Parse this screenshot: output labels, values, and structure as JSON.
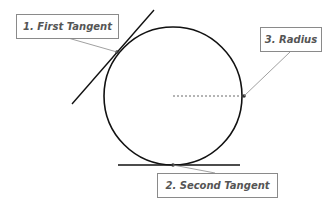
{
  "diagram": {
    "labels": {
      "first_tangent": "1. First Tangent",
      "second_tangent": "2. Second Tangent",
      "radius": "3. Radius"
    },
    "circle": {
      "cx": 173,
      "cy": 96,
      "r": 69
    },
    "colors": {
      "stroke": "#111111",
      "leader": "#888888",
      "label_text": "#555555",
      "label_border": "#8a8a8a"
    }
  }
}
